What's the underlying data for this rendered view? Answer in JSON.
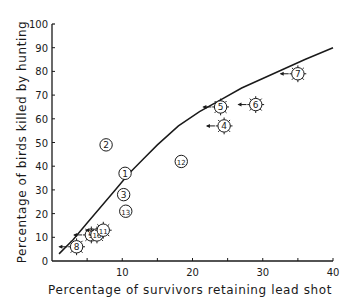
{
  "chart_data": {
    "type": "scatter",
    "title": "",
    "xlabel": "Percentage of survivors retaining lead shot",
    "ylabel": "Percentage of birds killed by hunting",
    "xlim": [
      0,
      40
    ],
    "ylim": [
      0,
      100
    ],
    "x_ticks": [
      0,
      5,
      10,
      15,
      20,
      25,
      30,
      35,
      40
    ],
    "x_tick_labels": [
      "10",
      "20",
      "30",
      "40"
    ],
    "y_ticks": [
      0,
      10,
      20,
      30,
      40,
      50,
      60,
      70,
      80,
      90,
      100
    ],
    "y_tick_labels": [
      "0",
      "10",
      "20",
      "30",
      "40",
      "50",
      "60",
      "70",
      "80",
      "90",
      "100"
    ],
    "grid": false,
    "legend": null,
    "points": [
      {
        "label": "1",
        "x": 10.4,
        "y": 37,
        "style": "circle",
        "arrow": false
      },
      {
        "label": "2",
        "x": 7.7,
        "y": 49,
        "style": "circle",
        "arrow": false
      },
      {
        "label": "3",
        "x": 10.2,
        "y": 28,
        "style": "circle",
        "arrow": false
      },
      {
        "label": "4",
        "x": 24.5,
        "y": 57,
        "style": "spiked",
        "arrow": true
      },
      {
        "label": "5",
        "x": 24.0,
        "y": 65,
        "style": "spiked",
        "arrow": true
      },
      {
        "label": "6",
        "x": 29.0,
        "y": 66,
        "style": "spiked",
        "arrow": true
      },
      {
        "label": "7",
        "x": 35.0,
        "y": 79,
        "style": "spiked",
        "arrow": true
      },
      {
        "label": "8",
        "x": 3.5,
        "y": 6,
        "style": "spiked",
        "arrow": true
      },
      {
        "label": "9",
        "x": 5.6,
        "y": 11,
        "style": "spiked",
        "arrow": true
      },
      {
        "label": "10",
        "x": 6.4,
        "y": 11,
        "style": "spiked",
        "arrow": false
      },
      {
        "label": "11",
        "x": 7.3,
        "y": 13,
        "style": "spiked",
        "arrow": true
      },
      {
        "label": "12",
        "x": 18.4,
        "y": 42,
        "style": "circle",
        "arrow": false
      },
      {
        "label": "13",
        "x": 10.5,
        "y": 21,
        "style": "circle",
        "arrow": false
      }
    ],
    "curve": {
      "name": "fitted curve",
      "x": [
        1,
        3,
        5,
        7,
        9,
        11,
        13,
        15,
        18,
        21,
        24,
        27,
        30,
        33,
        36,
        40
      ],
      "y": [
        3,
        9,
        16,
        23,
        30,
        37,
        43,
        49,
        57,
        63,
        68,
        73,
        77,
        81,
        85,
        90
      ]
    }
  }
}
